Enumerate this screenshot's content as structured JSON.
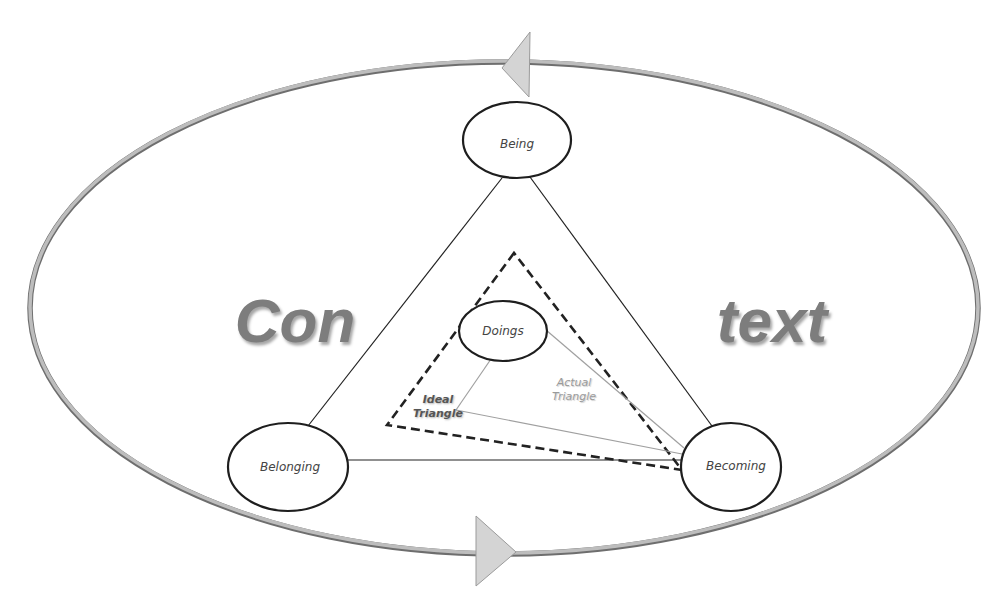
{
  "diagram": {
    "context_words": {
      "left": "Con",
      "right": "text"
    },
    "nodes": [
      {
        "id": "being",
        "label": "Being",
        "cx": 517,
        "cy": 140,
        "rx": 54,
        "ry": 38
      },
      {
        "id": "doings",
        "label": "Doings",
        "cx": 503,
        "cy": 331,
        "rx": 44,
        "ry": 30
      },
      {
        "id": "belonging",
        "label": "Belonging",
        "cx": 288,
        "cy": 467,
        "rx": 60,
        "ry": 44
      },
      {
        "id": "becoming",
        "label": "Becoming",
        "cx": 730,
        "cy": 467,
        "rx": 50,
        "ry": 44
      }
    ],
    "triangles": {
      "ideal": {
        "label_line1": "Ideal",
        "label_line2": "Triangle"
      },
      "actual": {
        "label_line1": "Actual",
        "label_line2": "Triangle"
      }
    },
    "cycle": {
      "top_arrow_direction": "left",
      "bottom_arrow_direction": "right"
    },
    "colors": {
      "outline": "#222222",
      "ring": "#b8b8b8",
      "ring_shadow": "#6e6e6e",
      "arrow_fill": "#d4d4d4",
      "actual_line": "#9c9c9c",
      "context_text": "#7d7d7d"
    }
  }
}
